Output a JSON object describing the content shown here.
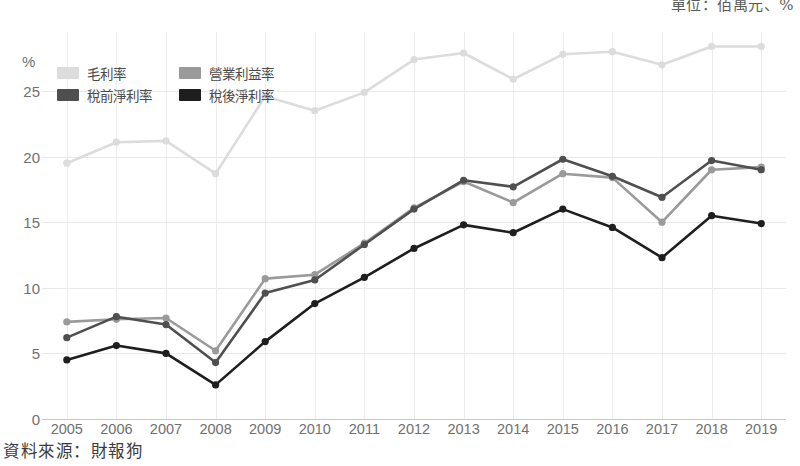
{
  "caption": {
    "unit_note": "單位：佰萬元、%",
    "source_note": "資料來源：財報狗"
  },
  "legend": {
    "position": "top-left-inside",
    "items": [
      {
        "label": "毛利率",
        "color": "#dcdcdc",
        "key": "gross_margin"
      },
      {
        "label": "營業利益率",
        "color": "#9a9a9a",
        "key": "operating_margin"
      },
      {
        "label": "稅前淨利率",
        "color": "#4f4f4f",
        "key": "pretax_margin"
      },
      {
        "label": "稅後淨利率",
        "color": "#1e1e1e",
        "key": "net_margin"
      }
    ]
  },
  "axis": {
    "y_unit_symbol": "%",
    "y_ticks": [
      "0",
      "5",
      "10",
      "15",
      "20",
      "25"
    ],
    "x_ticks": [
      "2005",
      "2006",
      "2007",
      "2008",
      "2009",
      "2010",
      "2011",
      "2012",
      "2013",
      "2014",
      "2015",
      "2016",
      "2017",
      "2018",
      "2019"
    ]
  },
  "chart_data": {
    "type": "line",
    "title": "",
    "subtitle": "",
    "xlabel": "",
    "ylabel": "%",
    "ylim": [
      0,
      29.5
    ],
    "yticks": [
      0,
      5,
      10,
      15,
      20,
      25
    ],
    "grid": true,
    "legend_position": "top-left",
    "markers": true,
    "unit_note": "單位：佰萬元、%",
    "source": "資料來源：財報狗",
    "categories": [
      "2005",
      "2006",
      "2007",
      "2008",
      "2009",
      "2010",
      "2011",
      "2012",
      "2013",
      "2014",
      "2015",
      "2016",
      "2017",
      "2018",
      "2019"
    ],
    "x": [
      2005,
      2006,
      2007,
      2008,
      2009,
      2010,
      2011,
      2012,
      2013,
      2014,
      2015,
      2016,
      2017,
      2018,
      2019
    ],
    "series": [
      {
        "name": "毛利率",
        "name_en": "Gross margin",
        "color": "#dcdcdc",
        "values": [
          19.5,
          21.1,
          21.2,
          18.7,
          24.6,
          23.5,
          24.9,
          27.4,
          27.9,
          25.9,
          27.8,
          28.0,
          27.0,
          28.4,
          28.4
        ]
      },
      {
        "name": "營業利益率",
        "name_en": "Operating margin",
        "color": "#9a9a9a",
        "values": [
          7.4,
          7.6,
          7.7,
          5.2,
          10.7,
          11.0,
          13.4,
          16.1,
          18.1,
          16.5,
          18.7,
          18.4,
          15.0,
          19.0,
          19.2
        ]
      },
      {
        "name": "稅前淨利率",
        "name_en": "Pre-tax net margin",
        "color": "#4f4f4f",
        "values": [
          6.2,
          7.8,
          7.2,
          4.3,
          9.6,
          10.6,
          13.3,
          16.0,
          18.2,
          17.7,
          19.8,
          18.5,
          16.9,
          19.7,
          19.0
        ]
      },
      {
        "name": "稅後淨利率",
        "name_en": "After-tax net margin",
        "color": "#1e1e1e",
        "values": [
          4.5,
          5.6,
          5.0,
          2.6,
          5.9,
          8.8,
          10.8,
          13.0,
          14.8,
          14.2,
          16.0,
          14.6,
          12.3,
          15.5,
          14.9
        ]
      }
    ]
  }
}
